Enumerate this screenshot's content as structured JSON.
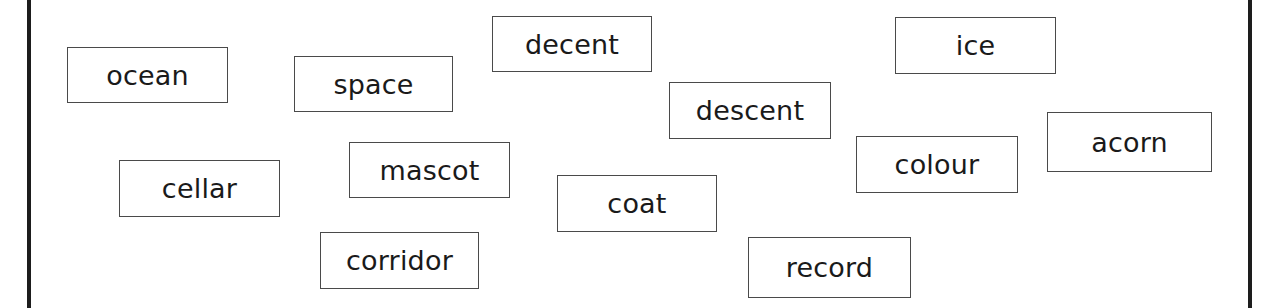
{
  "page": {
    "background_color": "#ffffff",
    "rule_color": "#1d1d1a",
    "card_border_color": "#4a4a4a",
    "card_text_color": "#1a1a1a",
    "width": 1270,
    "height": 308
  },
  "frame": {
    "left_rule_label": "left-margin-rule",
    "right_rule_label": "right-margin-rule"
  },
  "word_cards": [
    {
      "text": "ocean",
      "x": 67,
      "y": 47,
      "w": 161,
      "h": 56
    },
    {
      "text": "space",
      "x": 294,
      "y": 56,
      "w": 159,
      "h": 56
    },
    {
      "text": "decent",
      "x": 492,
      "y": 16,
      "w": 160,
      "h": 56
    },
    {
      "text": "ice",
      "x": 895,
      "y": 17,
      "w": 161,
      "h": 57
    },
    {
      "text": "descent",
      "x": 669,
      "y": 82,
      "w": 162,
      "h": 57
    },
    {
      "text": "acorn",
      "x": 1047,
      "y": 112,
      "w": 165,
      "h": 60
    },
    {
      "text": "colour",
      "x": 856,
      "y": 136,
      "w": 162,
      "h": 57
    },
    {
      "text": "cellar",
      "x": 119,
      "y": 160,
      "w": 161,
      "h": 57
    },
    {
      "text": "mascot",
      "x": 349,
      "y": 142,
      "w": 161,
      "h": 56
    },
    {
      "text": "coat",
      "x": 557,
      "y": 175,
      "w": 160,
      "h": 57
    },
    {
      "text": "corridor",
      "x": 320,
      "y": 232,
      "w": 159,
      "h": 57
    },
    {
      "text": "record",
      "x": 748,
      "y": 237,
      "w": 163,
      "h": 61
    }
  ]
}
